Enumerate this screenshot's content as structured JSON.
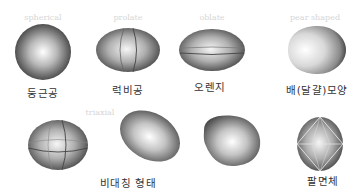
{
  "diagram": {
    "shapes": [
      {
        "id": "spherical",
        "watermark": "spherical",
        "label": "둥근공"
      },
      {
        "id": "prolate",
        "watermark": "prolate",
        "label": "럭비공"
      },
      {
        "id": "oblate",
        "watermark": "oblate",
        "label": "오렌지"
      },
      {
        "id": "pear-shaped",
        "watermark": "pear shaped",
        "label": "배(달걀)모양"
      },
      {
        "id": "triaxial",
        "watermark": "triaxial",
        "label": ""
      },
      {
        "id": "asymmetric-1",
        "watermark": "",
        "label": "비대칭 형태"
      },
      {
        "id": "asymmetric-2",
        "watermark": "",
        "label": ""
      },
      {
        "id": "octahedral",
        "watermark": "",
        "label": "팔면체"
      }
    ],
    "group_labels": {
      "asymmetric": "비대칭 형태"
    }
  }
}
